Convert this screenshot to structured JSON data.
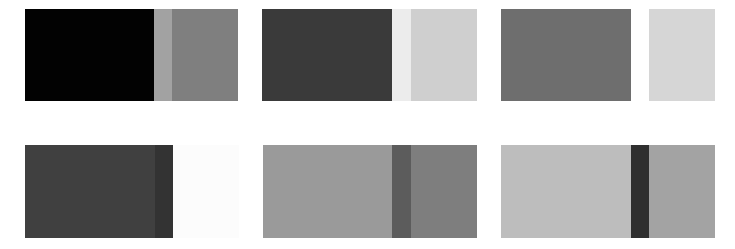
{
  "figure": {
    "background": "#ffffff",
    "panels": [
      {
        "id": 1,
        "x": 25,
        "y": 9,
        "height": 92,
        "segments": [
          {
            "role": "left-block",
            "width": 129,
            "color": "#020202"
          },
          {
            "role": "middle-band",
            "width": 18,
            "color": "#a2a2a2"
          },
          {
            "role": "right-block",
            "width": 66,
            "color": "#7f7f7f"
          }
        ]
      },
      {
        "id": 2,
        "x": 262,
        "y": 9,
        "height": 92,
        "segments": [
          {
            "role": "left-block",
            "width": 130,
            "color": "#3a3a3a"
          },
          {
            "role": "middle-band",
            "width": 19,
            "color": "#ececec"
          },
          {
            "role": "right-block",
            "width": 66,
            "color": "#cfcfcf"
          }
        ]
      },
      {
        "id": 3,
        "x": 501,
        "y": 9,
        "height": 92,
        "segments": [
          {
            "role": "left-block",
            "width": 130,
            "color": "#6e6e6e"
          },
          {
            "role": "middle-band",
            "width": 18,
            "color": "#ffffff"
          },
          {
            "role": "right-block",
            "width": 66,
            "color": "#d6d6d6"
          }
        ]
      },
      {
        "id": 4,
        "x": 25,
        "y": 145,
        "height": 93,
        "segments": [
          {
            "role": "left-block",
            "width": 130,
            "color": "#404040"
          },
          {
            "role": "middle-band",
            "width": 18,
            "color": "#333333"
          },
          {
            "role": "right-block",
            "width": 66,
            "color": "#fcfcfc"
          }
        ]
      },
      {
        "id": 5,
        "x": 263,
        "y": 145,
        "height": 93,
        "segments": [
          {
            "role": "left-block",
            "width": 129,
            "color": "#9a9a9a"
          },
          {
            "role": "middle-band",
            "width": 19,
            "color": "#5c5c5c"
          },
          {
            "role": "right-block",
            "width": 66,
            "color": "#7e7e7e"
          }
        ]
      },
      {
        "id": 6,
        "x": 501,
        "y": 145,
        "height": 93,
        "segments": [
          {
            "role": "left-block",
            "width": 130,
            "color": "#bdbdbd"
          },
          {
            "role": "middle-band",
            "width": 18,
            "color": "#2f2f2f"
          },
          {
            "role": "right-block",
            "width": 66,
            "color": "#a3a3a3"
          }
        ]
      }
    ]
  }
}
